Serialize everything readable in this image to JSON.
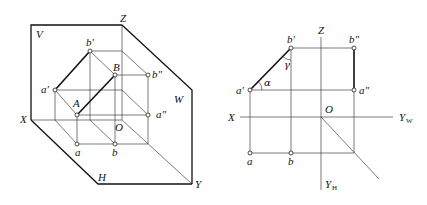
{
  "left_figure": {
    "description": "Pictorial (3D) view of line AB projected onto V, H, W planes",
    "planes": {
      "V": "V",
      "H": "H",
      "W": "W"
    },
    "axes": {
      "X": "X",
      "Y": "Y",
      "Z": "Z",
      "origin": "O"
    },
    "points": {
      "A": "A",
      "B": "B",
      "a_prime": "a'",
      "b_prime": "b'",
      "a_double": "a\"",
      "b_double": "b\"",
      "a": "a",
      "b": "b"
    }
  },
  "right_figure": {
    "description": "Orthographic three-view projection of line AB",
    "axes": {
      "X": "X",
      "Z": "Z",
      "origin": "O",
      "Yw": "Y",
      "Yw_sub": "W",
      "Yh": "Y",
      "Yh_sub": "H"
    },
    "points": {
      "a_prime": "a'",
      "b_prime": "b'",
      "a_double": "a\"",
      "b_double": "b\"",
      "a": "a",
      "b": "b"
    },
    "angles": {
      "alpha": "α",
      "gamma": "γ"
    }
  }
}
